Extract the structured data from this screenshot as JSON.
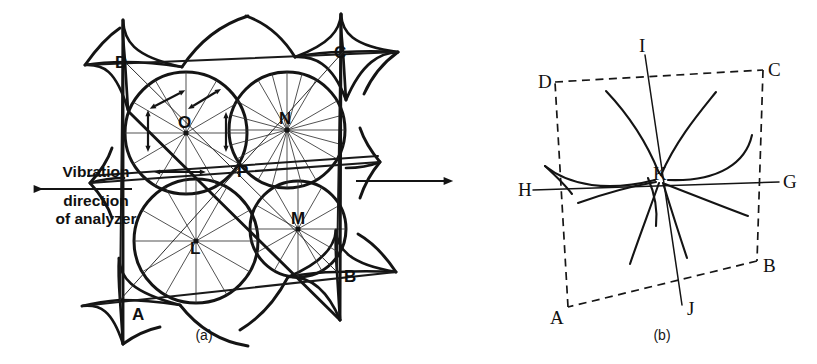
{
  "figure": {
    "background_color": "#ffffff",
    "ink_color": "#141414",
    "panels": [
      {
        "id": "a",
        "caption": "(a)",
        "description": "Conoscopic interference figure: four overlapping circles with radial extinction lines, bounded by hyperbolic isogyre cusps at corners A, B, C, D",
        "circle_labels": [
          "O",
          "N",
          "L",
          "M"
        ],
        "extra_point_label": "P",
        "corner_labels": [
          "D",
          "C",
          "A",
          "B"
        ]
      },
      {
        "id": "b",
        "caption": "(b)",
        "description": "Dashed parallelogram ABCD with isogyre curves crossing at melatope K; axis I-J and axis H-G",
        "corner_labels": [
          "D",
          "C",
          "A",
          "B"
        ],
        "axis_labels": [
          "I",
          "J",
          "H",
          "G"
        ],
        "center_label": "K"
      }
    ]
  },
  "annotation": {
    "vibration_line_1": "Vibration",
    "vibration_line_2": "direction",
    "vibration_line_3": "of analyzer",
    "left_arrow_icon": "arrow-left-icon",
    "right_arrow_icon": "arrow-right-icon"
  },
  "panel_a": {
    "caption": "(a)",
    "labels": {
      "O": "O",
      "N": "N",
      "L": "L",
      "M": "M",
      "P": "P",
      "A": "A",
      "B": "B",
      "C": "C",
      "D": "D"
    }
  },
  "panel_b": {
    "caption": "(b)",
    "labels": {
      "A": "A",
      "B": "B",
      "C": "C",
      "D": "D",
      "G": "G",
      "H": "H",
      "I": "I",
      "J": "J",
      "K": "K"
    }
  }
}
